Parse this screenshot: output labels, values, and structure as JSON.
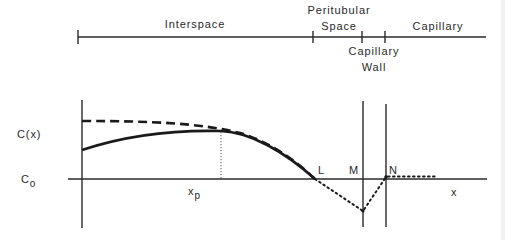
{
  "regions": {
    "interspace": "Interspace",
    "peritubular_line1": "Peritubular",
    "peritubular_line2": "Space",
    "capillary_wall_line1": "Capillary",
    "capillary_wall_line2": "Wall",
    "capillary": "Capillary"
  },
  "axis_labels": {
    "y_curve": "C(x)",
    "y_baseline": "C",
    "y_baseline_sub": "o",
    "x_peak": "x",
    "x_peak_sub": "p",
    "x_axis": "x"
  },
  "points": {
    "L": "L",
    "M": "M",
    "N": "N"
  },
  "curves": {
    "solid": "concentration profile C(x) in interspace (rises to max at x_p, falls to C_o at L)",
    "dashed": "alternative profile starting higher, decreasing monotonically to L",
    "dotted": "profile across peritubular space and capillary wall: dips below C_o at M, returns to C_o at N, flat in capillary"
  },
  "colors": {
    "ink": "#222222",
    "background": "#ffffff"
  }
}
